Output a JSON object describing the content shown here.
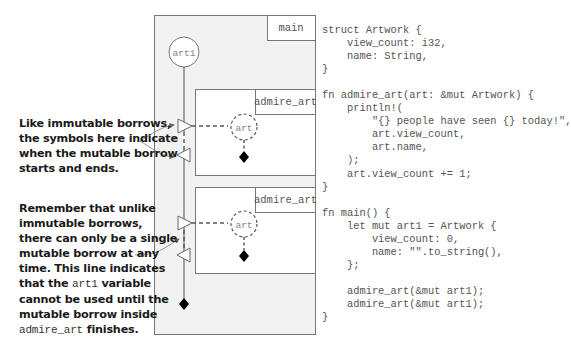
{
  "diagram": {
    "outer_scope_label": "main",
    "owner_variable": "art1",
    "inner_scopes": [
      {
        "label": "admire_art",
        "borrow_variable": "art"
      },
      {
        "label": "admire_art",
        "borrow_variable": "art"
      }
    ],
    "colors": {
      "scope_fill": "#f1f1f1",
      "inner_fill": "#ffffff",
      "stroke": "#777777",
      "diamond": "#000000"
    }
  },
  "annotations": [
    {
      "lines": [
        "Like immutable borrows,",
        "the symbols here indicate",
        "when the mutable borrow",
        "starts and ends."
      ]
    },
    {
      "lines": [
        "Remember that unlike",
        "immutable borrows,",
        "there can only be a single",
        "mutable borrow at any",
        "time. This line indicates"
      ],
      "line6_pre": "that the ",
      "line6_code": "art1",
      "line6_post": " variable",
      "line7": "cannot be used until the",
      "line8": "mutable borrow inside",
      "line9_code": "admire_art",
      "line9_post": " finishes."
    }
  ],
  "code": {
    "lines": [
      "struct Artwork {",
      "    view_count: i32,",
      "    name: String,",
      "}",
      "",
      "fn admire_art(art: &mut Artwork) {",
      "    println!(",
      "        \"{} people have seen {} today!\",",
      "        art.view_count,",
      "        art.name,",
      "    );",
      "    art.view_count += 1;",
      "}",
      "",
      "fn main() {",
      "    let mut art1 = Artwork {",
      "        view_count: 0,",
      "        name: \"\".to_string(),",
      "    };",
      "",
      "    admire_art(&mut art1);",
      "    admire_art(&mut art1);",
      "}"
    ]
  }
}
